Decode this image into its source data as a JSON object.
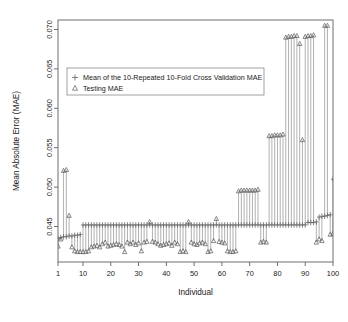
{
  "chart_data": {
    "type": "scatter",
    "title": "",
    "xlabel": "Individual",
    "ylabel": "Mean Absolute Error (MAE)",
    "xlim": [
      1,
      100
    ],
    "ylim": [
      0.0405,
      0.0712
    ],
    "grid": false,
    "legend_position": "top-left",
    "xticks": [
      1,
      10,
      20,
      30,
      40,
      50,
      60,
      70,
      80,
      90,
      100
    ],
    "xtick_labels": [
      "1",
      "10",
      "20",
      "30",
      "40",
      "50",
      "60",
      "70",
      "80",
      "90",
      "100"
    ],
    "yticks": [
      0.045,
      0.05,
      0.055,
      0.06,
      0.065,
      0.07
    ],
    "ytick_labels": [
      "0.045",
      "0.050",
      "0.055",
      "0.060",
      "0.065",
      "0.070"
    ],
    "legend": [
      {
        "marker": "plus",
        "label": "Mean of the 10-Repeated 10-Fold Cross Validation MAE"
      },
      {
        "marker": "triangle",
        "label": "Testing MAE"
      }
    ],
    "x": [
      1,
      2,
      3,
      4,
      5,
      6,
      7,
      8,
      9,
      10,
      11,
      12,
      13,
      14,
      15,
      16,
      17,
      18,
      19,
      20,
      21,
      22,
      23,
      24,
      25,
      26,
      27,
      28,
      29,
      30,
      31,
      32,
      33,
      34,
      35,
      36,
      37,
      38,
      39,
      40,
      41,
      42,
      43,
      44,
      45,
      46,
      47,
      48,
      49,
      50,
      51,
      52,
      53,
      54,
      55,
      56,
      57,
      58,
      59,
      60,
      61,
      62,
      63,
      64,
      65,
      66,
      67,
      68,
      69,
      70,
      71,
      72,
      73,
      74,
      75,
      76,
      77,
      78,
      79,
      80,
      81,
      82,
      83,
      84,
      85,
      86,
      87,
      88,
      89,
      90,
      91,
      92,
      93,
      94,
      95,
      96,
      97,
      98,
      99,
      100
    ],
    "series": [
      {
        "name": "Mean of the 10-Repeated 10-Fold Cross Validation MAE",
        "marker": "plus",
        "values": [
          0.0435,
          0.0436,
          0.0437,
          0.0437,
          0.0438,
          0.0438,
          0.0439,
          0.0439,
          0.044,
          0.0452,
          0.0452,
          0.0452,
          0.0452,
          0.0452,
          0.0452,
          0.0452,
          0.0452,
          0.0452,
          0.0452,
          0.0452,
          0.0452,
          0.0452,
          0.0452,
          0.0452,
          0.0452,
          0.0452,
          0.0452,
          0.0452,
          0.0452,
          0.0452,
          0.0452,
          0.0452,
          0.0452,
          0.0452,
          0.0452,
          0.0452,
          0.0452,
          0.0452,
          0.0452,
          0.0452,
          0.0452,
          0.0452,
          0.0452,
          0.0452,
          0.0452,
          0.0452,
          0.0452,
          0.0452,
          0.0452,
          0.0452,
          0.0452,
          0.0452,
          0.0452,
          0.0452,
          0.0452,
          0.0452,
          0.0452,
          0.0452,
          0.0452,
          0.0452,
          0.0452,
          0.0452,
          0.0452,
          0.0452,
          0.0452,
          0.0452,
          0.0452,
          0.0452,
          0.0452,
          0.0452,
          0.0452,
          0.0452,
          0.0452,
          0.0452,
          0.0452,
          0.0452,
          0.0452,
          0.0452,
          0.0452,
          0.0452,
          0.0452,
          0.0452,
          0.0452,
          0.0452,
          0.0452,
          0.0452,
          0.0452,
          0.0452,
          0.0452,
          0.0452,
          0.0455,
          0.0455,
          0.0455,
          0.0456,
          0.0462,
          0.0463,
          0.0463,
          0.0464,
          0.0465,
          0.051
        ]
      },
      {
        "name": "Testing MAE",
        "marker": "triangle",
        "values": [
          0.0425,
          0.0434,
          0.0521,
          0.0522,
          0.0464,
          0.0424,
          0.0419,
          0.0418,
          0.0418,
          0.0418,
          0.0418,
          0.0419,
          0.0424,
          0.0425,
          0.0426,
          0.0424,
          0.0428,
          0.043,
          0.0425,
          0.0426,
          0.0427,
          0.0428,
          0.0427,
          0.0425,
          0.0418,
          0.043,
          0.0428,
          0.043,
          0.0427,
          0.0429,
          0.0419,
          0.043,
          0.0431,
          0.0456,
          0.0431,
          0.043,
          0.0428,
          0.0426,
          0.0427,
          0.0428,
          0.0429,
          0.0426,
          0.043,
          0.0428,
          0.0418,
          0.0419,
          0.0418,
          0.0456,
          0.043,
          0.0428,
          0.0427,
          0.0429,
          0.043,
          0.0428,
          0.0418,
          0.0419,
          0.0432,
          0.046,
          0.0431,
          0.043,
          0.0429,
          0.0419,
          0.0418,
          0.0418,
          0.0419,
          0.0495,
          0.0496,
          0.0496,
          0.0496,
          0.0496,
          0.0496,
          0.0496,
          0.0497,
          0.043,
          0.0431,
          0.043,
          0.0565,
          0.0565,
          0.0566,
          0.0566,
          0.0566,
          0.0567,
          0.069,
          0.0691,
          0.0691,
          0.0692,
          0.0692,
          0.0682,
          0.056,
          0.0691,
          0.0692,
          0.0692,
          0.0693,
          0.043,
          0.0434,
          0.0432,
          0.0705,
          0.0705,
          0.044,
          0.0441
        ]
      }
    ]
  }
}
